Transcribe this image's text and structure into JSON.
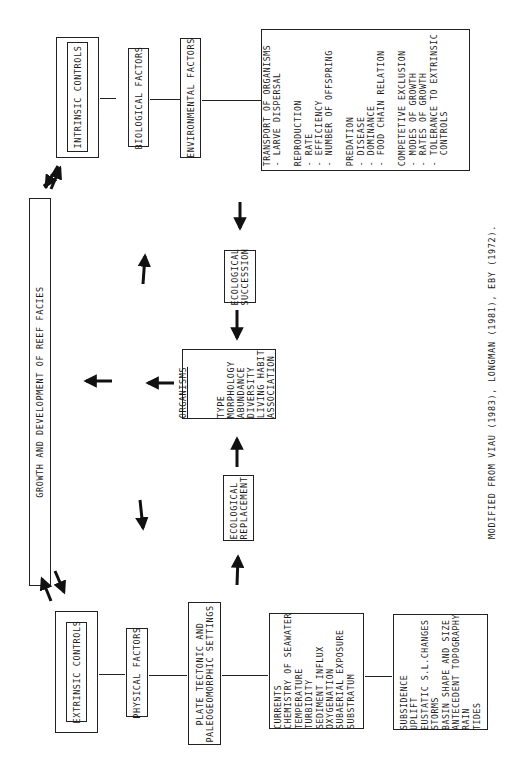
{
  "diagram": {
    "central": {
      "label": "GROWTH AND DEVELOPMENT OF REEF FACIES"
    },
    "intrinsic": {
      "title": "INTRINSIC CONTROLS",
      "factor1": "BIOLOGICAL FACTORS",
      "factor2": "ENVIRONMENTAL FACTORS",
      "details": "TRANSPORT OF ORGANISMS\n- LARVE DISPERSAL\n\nREPRODUCTION\n- RATE\n- EFFICIENCY\n- NUMBER OF OFFSPRING\n\nPREDATION\n- DISEASE\n- DOMINANCE\n- FOOD CHAIN RELATION\n\nCOMPETETIVE EXCLUSION\n- MODES OF GROWTH\n- RATES OF GROWTH\n- TOLERANCE TO EXTRINSIC\n  CONTROLS"
    },
    "extrinsic": {
      "title": "EXTRINSIC CONTROLS",
      "factor1": "PHYSICAL FACTORS",
      "factor2": "PLATE TECTONIC AND\nPALEOGEOMORPHIC SETTINGS",
      "details1": "CURRENTS\nCHEMISTRY OF SEAWATER\nTEMPERATURE\nTURBIDITY\nSEDIMENT INFLUX\nOXYGENATION\nSUBAERIAL EXPOSURE\nSUBSTRATUM",
      "details2": "SUBSIDENCE\nUPLIFT\nEUSTATIC S.L.CHANGES\nSTORMS\nBASIN SHAPE AND SIZE\nANTECEDENT TOPOGRAPHY\nRAIN\nTIDES"
    },
    "organisms": {
      "title": "ORGANISMS",
      "attributes": "TYPE\nMORPHOLOGY\nABUNDANCE\nDIVERSITY\nLIVING HABIT\nASSOCIATION"
    },
    "succession": {
      "label": "ECOLOGICAL\nSUCCESSION"
    },
    "replacement": {
      "label": "ECOLOGICAL\nREPLACEMENT"
    },
    "caption": "MODIFIED FROM VIAU (1983), LONGMAN (1981), EBY (1972)."
  }
}
